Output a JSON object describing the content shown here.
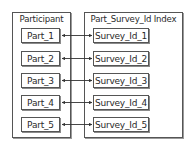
{
  "diagram": {
    "left_group": {
      "title": "Participant"
    },
    "right_group": {
      "title": "Part_Survey_Id Index"
    },
    "participants": [
      "Part_1",
      "Part_2",
      "Part_3",
      "Part_4",
      "Part_5"
    ],
    "survey_ids": [
      "Survey_Id_1",
      "Survey_Id_2",
      "Survey_Id_3",
      "Survey_Id_4",
      "Survey_Id_5"
    ],
    "links": [
      {
        "from": "Part_1",
        "to": "Survey_Id_1",
        "direction": "bidirectional"
      },
      {
        "from": "Part_2",
        "to": "Survey_Id_2",
        "direction": "bidirectional"
      },
      {
        "from": "Part_3",
        "to": "Survey_Id_3",
        "direction": "bidirectional"
      },
      {
        "from": "Part_4",
        "to": "Survey_Id_4",
        "direction": "bidirectional"
      },
      {
        "from": "Part_5",
        "to": "Survey_Id_5",
        "direction": "bidirectional"
      }
    ],
    "colors": {
      "stroke": "#555555",
      "shadow": "#8a8a8a",
      "background": "#ffffff",
      "text": "#2a2a2a"
    }
  }
}
